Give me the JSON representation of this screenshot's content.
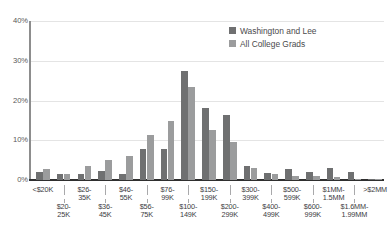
{
  "chart_data": {
    "type": "bar",
    "title": "",
    "subtitle": "",
    "xlabel": "",
    "ylabel": "",
    "ylim": [
      0,
      40
    ],
    "yticks": [
      0,
      10,
      20,
      30,
      40
    ],
    "ytick_labels": [
      "0%",
      "10%",
      "20%",
      "30%",
      "40%"
    ],
    "grid": true,
    "legend_position": "top-right",
    "categories": [
      "<$20K",
      "$20-\n25K",
      "$26-\n35K",
      "$36-\n45K",
      "$46-\n55K",
      "$56-\n75K",
      "$76-\n99K",
      "$100-\n149K",
      "$150-\n199K",
      "$200-\n299K",
      "$300-\n399K",
      "$400-\n499K",
      "$500-\n599K",
      "$600-\n999K",
      "$1MM-\n1.5MM",
      "$1.6MM-\n1.99MM",
      ">$2MM"
    ],
    "series": [
      {
        "name": "Washington and Lee",
        "color": "#6f7071",
        "values": [
          2.1,
          1.4,
          1.4,
          2.3,
          1.6,
          7.8,
          7.8,
          27.3,
          18.2,
          16.4,
          3.6,
          1.8,
          2.8,
          1.9,
          2.9,
          2.1,
          0.3
        ]
      },
      {
        "name": "All College Grads",
        "color": "#9b9c9d",
        "values": [
          2.7,
          1.6,
          3.5,
          5.0,
          6.1,
          11.3,
          14.8,
          23.4,
          12.5,
          9.6,
          3.0,
          1.4,
          1.1,
          1.1,
          0.8,
          0.3,
          0.3
        ]
      }
    ]
  },
  "legend": {
    "items": [
      {
        "label": "Washington and Lee",
        "color": "#6f7071"
      },
      {
        "label": "All College Grads",
        "color": "#9b9c9d"
      }
    ]
  },
  "axes": {
    "y": {
      "labels": [
        "40%",
        "30%",
        "20%",
        "10%",
        "0%"
      ]
    }
  }
}
